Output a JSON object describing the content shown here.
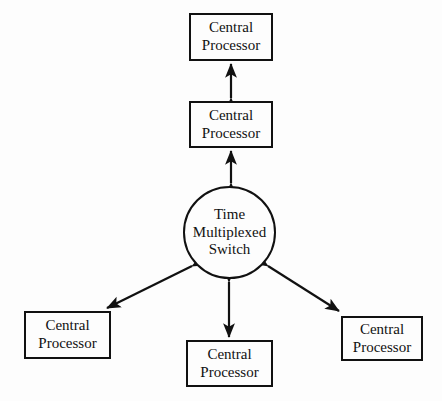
{
  "diagram": {
    "background_color": "#fdfdfd",
    "stroke_color": "#111111",
    "nodes": {
      "cpu_top": {
        "shape": "rectangle",
        "line1": "Central",
        "line2": "Processor"
      },
      "cpu_second": {
        "shape": "rectangle",
        "line1": "Central",
        "line2": "Processor"
      },
      "switch": {
        "shape": "circle",
        "line1": "Time",
        "line2": "Multiplexed",
        "line3": "Switch"
      },
      "cpu_bottom_left": {
        "shape": "rectangle",
        "line1": "Central",
        "line2": "Processor"
      },
      "cpu_bottom_center": {
        "shape": "rectangle",
        "line1": "Central",
        "line2": "Processor"
      },
      "cpu_bottom_right": {
        "shape": "rectangle",
        "line1": "Central",
        "line2": "Processor"
      }
    },
    "connectors": [
      {
        "id": "top-to-second",
        "from": "cpu_second",
        "to": "cpu_top",
        "style": "double-headed-arrow",
        "orientation": "vertical"
      },
      {
        "id": "second-to-switch",
        "from": "switch",
        "to": "cpu_second",
        "style": "double-headed-arrow",
        "orientation": "vertical"
      },
      {
        "id": "switch-to-bottomleft",
        "from": "switch",
        "to": "cpu_bottom_left",
        "style": "double-headed-arrow",
        "orientation": "diagonal"
      },
      {
        "id": "switch-to-bottomctr",
        "from": "switch",
        "to": "cpu_bottom_center",
        "style": "double-headed-arrow",
        "orientation": "vertical"
      },
      {
        "id": "switch-to-bottomright",
        "from": "switch",
        "to": "cpu_bottom_right",
        "style": "double-headed-arrow",
        "orientation": "diagonal"
      }
    ]
  }
}
